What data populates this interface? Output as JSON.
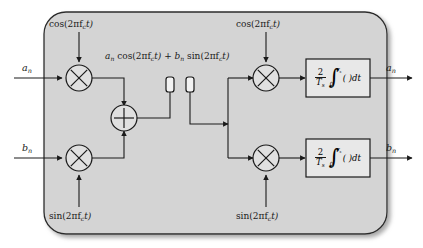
{
  "diagram": {
    "panel_color": "#d4d4d4",
    "line_color": "#1a1a1a",
    "box_fill": "#e8e8e8",
    "circle_fill": "#e0e0e0"
  },
  "inputs": {
    "a_in": "a",
    "a_in_sub": "n",
    "b_in": "b",
    "b_in_sub": "n"
  },
  "outputs": {
    "a_out": "a",
    "a_out_sub": "n",
    "b_out": "b",
    "b_out_sub": "n"
  },
  "carriers": {
    "tx_cos": "cos(2πf",
    "tx_cos_sub": "c",
    "tx_cos_tail": "t)",
    "tx_sin": "sin(2πf",
    "tx_sin_sub": "c",
    "tx_sin_tail": "t)",
    "rx_cos": "cos(2πf",
    "rx_cos_sub": "c",
    "rx_cos_tail": "t)",
    "rx_sin": "sin(2πf",
    "rx_sin_sub": "c",
    "rx_sin_tail": "t)"
  },
  "composite_signal": {
    "part1": "a",
    "part1_sub": "n",
    "part2": " cos(2πf",
    "part2_sub": "c",
    "part3": "t) + b",
    "part3_sub": "n",
    "part4": " sin(2πf",
    "part4_sub": "c",
    "part5": "t)"
  },
  "integrator": {
    "numerator": "2",
    "denominator": "T",
    "denominator_sub": "s",
    "integral_symbol": "∫",
    "upper_limit": "T",
    "upper_limit_sub": "s",
    "lower_limit": "0",
    "integrand": "( )dt"
  },
  "operators": {
    "multiply_symbol": "×",
    "sum_symbol": "+"
  },
  "antennas": {
    "tx_label": "transmit-antenna",
    "rx_label": "receive-antenna"
  }
}
